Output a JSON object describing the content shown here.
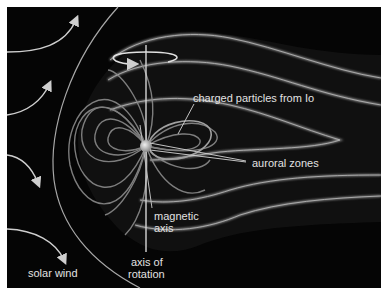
{
  "diagram": {
    "background": "#050505",
    "border": "#ffffff",
    "line_color": "#d8d8d8",
    "field_line_color": "#9a9a9a",
    "labels": {
      "charged_particles": "charged particles from Io",
      "auroral_zones": "auroral zones",
      "magnetic_axis_line1": "magnetic",
      "magnetic_axis_line2": "axis",
      "axis_rotation_line1": "axis of",
      "axis_rotation_line2": "rotation",
      "solar_wind": "solar wind"
    },
    "elements": {
      "planet": "Jupiter",
      "solar_wind_arrows": 4,
      "bow_shock": "bow-shock-arc",
      "rotation_arrow": "rotation-ellipse-arrow"
    }
  }
}
